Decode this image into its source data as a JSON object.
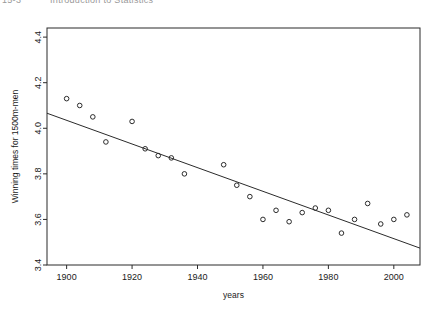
{
  "header": {
    "cropped_text_left": "15-3",
    "cropped_text_right": "Introduction to Statistics"
  },
  "chart_data": {
    "type": "scatter",
    "title": "",
    "xlabel": "years",
    "ylabel": "Winning times for 1500m-men",
    "xlim": [
      1894,
      2008
    ],
    "ylim": [
      3.4,
      4.44
    ],
    "grid": false,
    "legend": null,
    "marker": "open-circle",
    "xticks": [
      1900,
      1920,
      1940,
      1960,
      1980,
      2000
    ],
    "xtick_labels": [
      "1900",
      "1920",
      "1940",
      "1960",
      "1980",
      "2000"
    ],
    "yticks": [
      3.4,
      3.6,
      3.8,
      4.0,
      4.2,
      4.4
    ],
    "ytick_labels": [
      "3.4",
      "3.6",
      "3.8",
      "4.0",
      "4.2",
      "4.4"
    ],
    "x": [
      1900,
      1904,
      1908,
      1912,
      1920,
      1924,
      1928,
      1932,
      1936,
      1948,
      1952,
      1956,
      1960,
      1964,
      1968,
      1972,
      1976,
      1980,
      1984,
      1988,
      1992,
      1996,
      2000,
      2004
    ],
    "y": [
      4.13,
      4.1,
      4.05,
      3.94,
      4.03,
      3.91,
      3.88,
      3.87,
      3.8,
      3.84,
      3.75,
      3.7,
      3.6,
      3.64,
      3.59,
      3.63,
      3.65,
      3.64,
      3.54,
      3.6,
      3.67,
      3.58,
      3.6,
      3.62
    ],
    "trendline": {
      "type": "linear-fit",
      "x_start": 1894,
      "y_start": 4.066,
      "x_end": 2008,
      "y_end": 3.474
    }
  },
  "plot_frame": {
    "left": 47,
    "right": 420,
    "top": 28,
    "bottom": 265
  }
}
